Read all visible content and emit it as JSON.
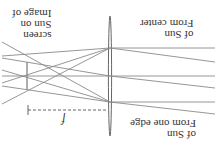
{
  "figure": {
    "orientation": "rotated-180",
    "labels": {
      "image_line1": "Image of",
      "image_line2": "Sun on",
      "image_line3": "screen",
      "center_line1": "From center",
      "center_line2": "of Sun",
      "edge_line1": "From one edge",
      "edge_line2": "of Sun",
      "focal": "f"
    },
    "colors": {
      "ray": "#8a8a8a",
      "lens": "#666666",
      "text": "#333333"
    }
  }
}
